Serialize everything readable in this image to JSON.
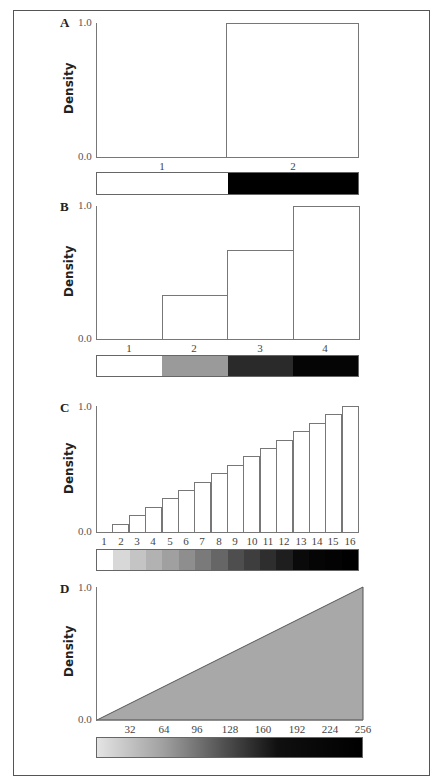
{
  "chart_data": [
    {
      "panel": "A",
      "type": "bar",
      "ylabel": "Density",
      "ylim": [
        0.0,
        1.0
      ],
      "yticks": [
        "0.0",
        "1.0"
      ],
      "categories": [
        "1",
        "2"
      ],
      "values": [
        0.0,
        1.0
      ],
      "colorbar": [
        "#ffffff",
        "#000000"
      ]
    },
    {
      "panel": "B",
      "type": "bar",
      "ylabel": "Density",
      "ylim": [
        0.0,
        1.0
      ],
      "yticks": [
        "0.0",
        "1.0"
      ],
      "categories": [
        "1",
        "2",
        "3",
        "4"
      ],
      "values": [
        0.0,
        0.333,
        0.667,
        1.0
      ],
      "colorbar": [
        "#ffffff",
        "#9a9a9a",
        "#2a2a2a",
        "#050505"
      ]
    },
    {
      "panel": "C",
      "type": "bar",
      "ylabel": "Density",
      "ylim": [
        0.0,
        1.0
      ],
      "yticks": [
        "0.0",
        "1.0"
      ],
      "categories": [
        "1",
        "2",
        "3",
        "4",
        "5",
        "6",
        "7",
        "8",
        "9",
        "10",
        "11",
        "12",
        "13",
        "14",
        "15",
        "16"
      ],
      "values": [
        0.0,
        0.067,
        0.133,
        0.2,
        0.267,
        0.333,
        0.4,
        0.467,
        0.533,
        0.6,
        0.667,
        0.733,
        0.8,
        0.867,
        0.933,
        1.0
      ],
      "colorbar": [
        "#ffffff",
        "#d8d8d8",
        "#c4c4c4",
        "#b2b2b2",
        "#a0a0a0",
        "#8e8e8e",
        "#7a7a7a",
        "#666666",
        "#4e4e4e",
        "#3e3e3e",
        "#2e2e2e",
        "#1e1e1e",
        "#0a0a0a",
        "#050505",
        "#030303",
        "#000000"
      ]
    },
    {
      "panel": "D",
      "type": "area",
      "ylabel": "Density",
      "ylim": [
        0.0,
        1.0
      ],
      "xlim": [
        0,
        256
      ],
      "yticks": [
        "0.0",
        "1.0"
      ],
      "xticks": [
        "32",
        "64",
        "96",
        "128",
        "160",
        "192",
        "224",
        "256"
      ],
      "x": [
        0,
        256
      ],
      "values": [
        0.0,
        1.0
      ],
      "fill": "#a8a8a8",
      "colorbar": "linear gradient light gray to black"
    }
  ],
  "panels": [
    {
      "label": "A",
      "ylabel": "Density",
      "ytop": "1.0",
      "ybottom": "0.0"
    },
    {
      "label": "B",
      "ylabel": "Density",
      "ytop": "1.0",
      "ybottom": "0.0"
    },
    {
      "label": "C",
      "ylabel": "Density",
      "ytop": "1.0",
      "ybottom": "0.0"
    },
    {
      "label": "D",
      "ylabel": "Density",
      "ytop": "1.0",
      "ybottom": "0.0"
    }
  ]
}
